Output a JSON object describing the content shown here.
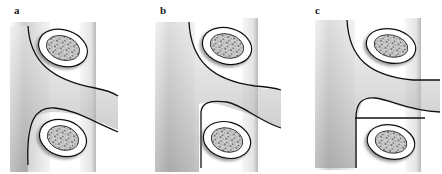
{
  "figure": {
    "panels": [
      {
        "id": "a",
        "label": "a",
        "variant": "free-root"
      },
      {
        "id": "b",
        "label": "b",
        "variant": "root-with-lower-notch"
      },
      {
        "id": "c",
        "label": "c",
        "variant": "root-with-horizontal-divider"
      }
    ]
  },
  "colors": {
    "background": "#ffffff",
    "outline": "#111111",
    "shade_dark": "#9a9a9a",
    "shade_light": "#f2f2f2",
    "speckle": "#6a6a6a"
  }
}
